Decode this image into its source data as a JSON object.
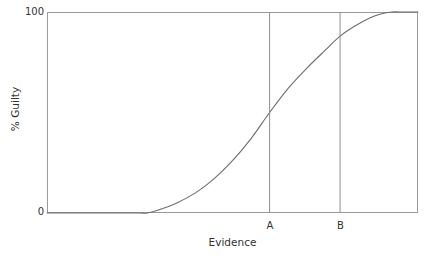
{
  "chart_data": {
    "type": "line",
    "title": "",
    "subtitle": "",
    "xlabel": "Evidence",
    "ylabel": "% Guilty",
    "xlim": [
      0,
      100
    ],
    "ylim": [
      0,
      100
    ],
    "grid": false,
    "legend": null,
    "xticks": [
      {
        "label": "A",
        "value": 60
      },
      {
        "label": "B",
        "value": 79
      }
    ],
    "yticks": [
      {
        "label": "0",
        "value": 0
      },
      {
        "label": "100",
        "value": 100
      }
    ],
    "series": [
      {
        "name": "Probability of guilty verdict",
        "color": "#6d6d6d",
        "x": [
          0,
          5,
          10,
          15,
          20,
          25,
          27,
          30,
          35,
          40,
          45,
          50,
          55,
          60,
          65,
          70,
          75,
          79,
          83,
          87,
          90,
          93,
          95,
          100
        ],
        "values": [
          0,
          0,
          0,
          0,
          0,
          0,
          0,
          1.5,
          5,
          10,
          17,
          26,
          37,
          50,
          62,
          72,
          81,
          88,
          93,
          97,
          99,
          100,
          100,
          100
        ]
      }
    ],
    "annotations": [
      {
        "kind": "vertical-line",
        "label": "A",
        "value": 60,
        "color": "#8f8f8f"
      },
      {
        "kind": "vertical-line",
        "label": "B",
        "value": 79,
        "color": "#8f8f8f"
      }
    ],
    "colors": {
      "curve": "#6d6d6d",
      "axis": "#9a9a9a",
      "threshold_line": "#8f8f8f",
      "text": "#333333",
      "background": "#ffffff"
    }
  }
}
